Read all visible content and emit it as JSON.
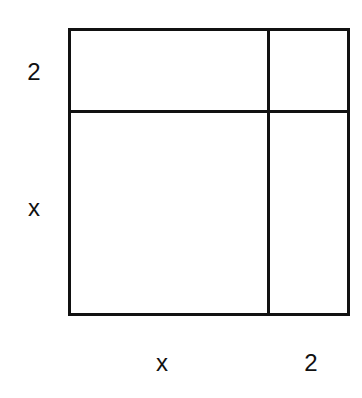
{
  "diagram": {
    "stroke_color": "#111111",
    "background_color": "#ffffff",
    "outer_box": {
      "left": 68,
      "top": 28,
      "right": 350,
      "bottom": 315
    },
    "vertical_divider_x": 268,
    "horizontal_divider_y": 111,
    "side_labels": {
      "left_top": "2",
      "left_bottom": "x",
      "bottom_left": "x",
      "bottom_right": "2"
    },
    "regions": [
      {
        "name": "top-left",
        "dims": "x by 2"
      },
      {
        "name": "top-right",
        "dims": "2 by 2"
      },
      {
        "name": "bottom-left",
        "dims": "x by x"
      },
      {
        "name": "bottom-right",
        "dims": "2 by x"
      }
    ]
  }
}
